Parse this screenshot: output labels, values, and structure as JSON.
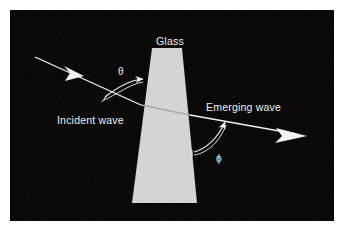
{
  "figure": {
    "background_color": "#0a0908",
    "border_color": "#ffffff",
    "stroke_color": "#f2f2f0",
    "width": 344,
    "height": 231
  },
  "glass": {
    "label": "Glass",
    "fill_color": "#d4d4d2",
    "shape": "tapered-slab",
    "top_left_x": 152,
    "top_right_x": 182,
    "top_y": 48,
    "bottom_left_x": 132,
    "bottom_right_x": 197,
    "bottom_y": 203
  },
  "labels": {
    "incident_wave": "Incident wave",
    "emerging_wave": "Emerging wave",
    "theta": "θ",
    "phi": "ϕ"
  },
  "rays": {
    "incident": {
      "name": "Incident wave",
      "start": [
        35,
        57
      ],
      "end": [
        141,
        105
      ],
      "arrow_at": [
        74,
        75
      ]
    },
    "internal": {
      "name": "Refracted ray inside glass",
      "start": [
        141,
        105
      ],
      "end": [
        190,
        115
      ]
    },
    "emerging": {
      "name": "Emerging wave",
      "start": [
        190,
        115
      ],
      "end": [
        307,
        136
      ],
      "arrow_at": [
        307,
        136
      ]
    }
  },
  "angles": {
    "theta": {
      "symbol": "θ",
      "name": "angle of incidence",
      "arc_from": [
        104,
        96
      ],
      "arc_to": [
        143,
        80
      ],
      "vertex": [
        141,
        105
      ]
    },
    "phi": {
      "symbol": "ϕ",
      "name": "angle of emergence",
      "arc_from": [
        192,
        148
      ],
      "arc_to": [
        224,
        121
      ],
      "vertex": [
        190,
        115
      ]
    }
  }
}
